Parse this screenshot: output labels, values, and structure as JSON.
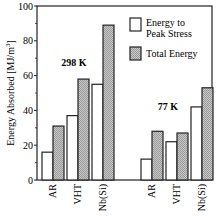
{
  "chart_data": {
    "type": "bar",
    "title": "",
    "xlabel": "",
    "ylabel": "Energy Absorbed [MJ/m3]",
    "ylabel_display": "Energy Absorbed [MJ/m",
    "ylabel_sup": "3",
    "ylabel_close": "]",
    "ylim": [
      0,
      100
    ],
    "yticks": [
      0,
      20,
      40,
      60,
      80,
      100
    ],
    "grid": false,
    "legend_position": "upper right",
    "groups": [
      {
        "name": "298 K",
        "categories": [
          "AR",
          "VHT",
          "Nb(Si)"
        ],
        "series": [
          {
            "name": "Energy to Peak Stress",
            "values": [
              16,
              37,
              55
            ]
          },
          {
            "name": "Total Energy",
            "values": [
              31,
              58,
              89
            ]
          }
        ]
      },
      {
        "name": "77 K",
        "categories": [
          "AR",
          "VHT",
          "Nb(Si)"
        ],
        "series": [
          {
            "name": "Energy to Peak Stress",
            "values": [
              12,
              22,
              42
            ]
          },
          {
            "name": "Total Energy",
            "values": [
              28,
              27,
              53
            ]
          }
        ]
      }
    ],
    "legend": [
      {
        "label_line1": "Energy to",
        "label_line2": "Peak Stress",
        "fill": "#ffffff"
      },
      {
        "label_line1": "Total Energy",
        "label_line2": "",
        "fill": "#bdbdbd"
      }
    ]
  }
}
